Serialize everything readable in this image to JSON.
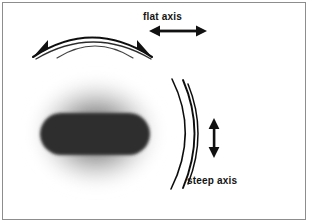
{
  "figure": {
    "name": "corneal-astigmatism-axes-diagram",
    "width": 309,
    "height": 223,
    "background_color": "#ffffff",
    "frame": {
      "border_color": "#8d8d8d",
      "border_width": 1,
      "inset": 2
    }
  },
  "labels": {
    "flat_axis": "flat axis",
    "steep_axis": "steep axis"
  },
  "colors": {
    "ink": "#141414",
    "stroke": "#111111",
    "capsule_fill": "#2e2e2e",
    "halo_inner": "#6f6f6f",
    "halo_outer": "#ffffff",
    "frame": "#8d8d8d"
  },
  "elements": {
    "halo": {
      "name": "blurred-gray-halo",
      "center_x": 96,
      "center_y": 133,
      "radius_x": 72,
      "radius_y": 62
    },
    "capsule": {
      "name": "dark-capsule-shape",
      "x": 40,
      "y": 113,
      "width": 110,
      "height": 42,
      "corner_radius": 21
    },
    "flat_arcs": {
      "name": "flat-meridian-arc-group",
      "count": 2,
      "orientation": "opens-downward"
    },
    "steep_arcs": {
      "name": "steep-meridian-arc-group",
      "count": 3,
      "orientation": "opens-leftward"
    },
    "flat_arrow": {
      "name": "flat-axis-double-arrow",
      "orientation": "horizontal",
      "x1": 150,
      "x2": 206,
      "y": 31
    },
    "steep_arrow": {
      "name": "steep-axis-double-arrow",
      "orientation": "vertical",
      "x": 214,
      "y1": 119,
      "y2": 157
    },
    "arc_arrowheads": {
      "name": "flat-arc-end-arrowheads",
      "count": 2
    }
  }
}
